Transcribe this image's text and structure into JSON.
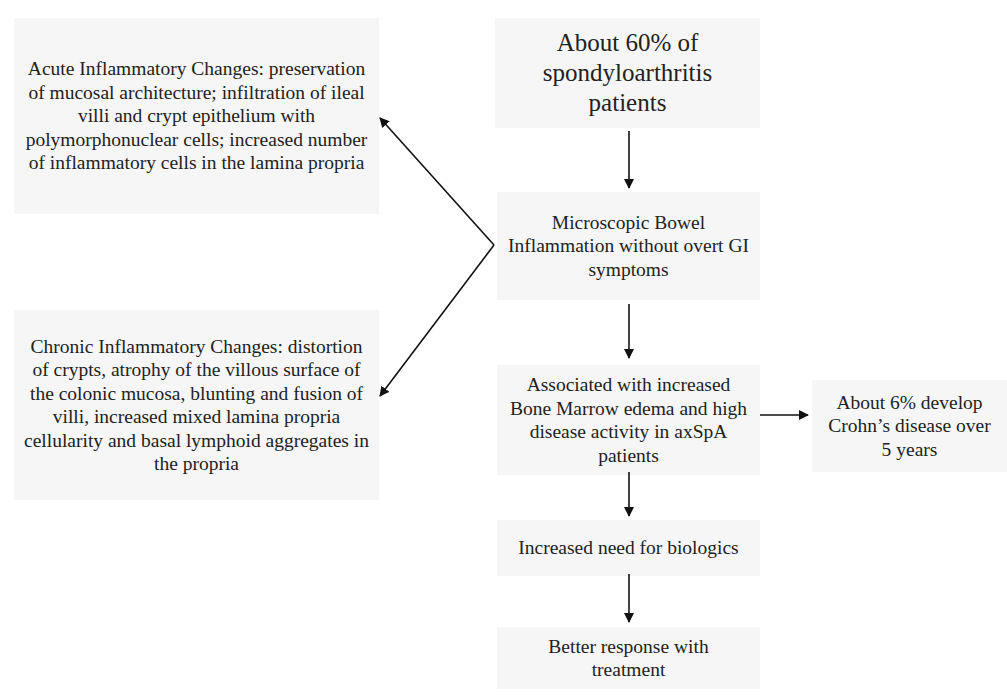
{
  "diagram": {
    "nodes": {
      "start": "About 60% of spondyloarthritis patients",
      "microscopic": "Microscopic Bowel Inflammation without overt GI symptoms",
      "associated": "Associated with increased Bone Marrow edema and high disease activity in axSpA patients",
      "crohns": "About 6% develop Crohn’s disease over 5 years",
      "biologics": "Increased need for biologics",
      "response": "Better response with treatment",
      "acute": "Acute Inflammatory Changes: preservation of mucosal architecture; infiltration of ileal villi and crypt epithelium with polymorphonuclear cells; increased number of inflammatory cells in the lamina propria",
      "chronic": "Chronic Inflammatory Changes: distortion of crypts, atrophy of the villous surface of the colonic mucosa, blunting and fusion of villi, increased mixed lamina propria cellularity and basal lymphoid aggregates in the propria"
    },
    "edges": [
      [
        "start",
        "microscopic"
      ],
      [
        "microscopic",
        "acute"
      ],
      [
        "microscopic",
        "chronic"
      ],
      [
        "microscopic",
        "associated"
      ],
      [
        "associated",
        "crohns"
      ],
      [
        "associated",
        "biologics"
      ],
      [
        "biologics",
        "response"
      ]
    ],
    "colors": {
      "box_bg": "#f6f6f6",
      "text": "#222222",
      "arrow": "#111111"
    }
  }
}
